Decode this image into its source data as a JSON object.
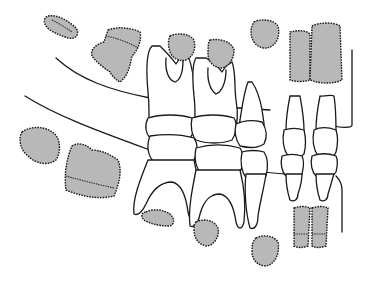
{
  "figure": {
    "colors": {
      "background": "#ffffff",
      "outline": "#1a1a1a",
      "tooth_germ_fill": "#b8b8b8"
    },
    "labels": []
  }
}
